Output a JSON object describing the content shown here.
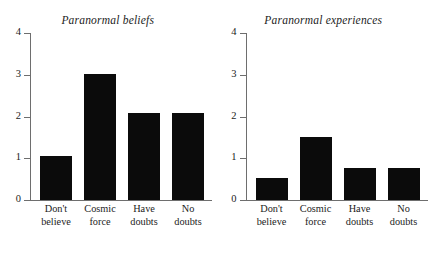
{
  "figure": {
    "background_color": "#ffffff",
    "bar_color": "#0b0b0b",
    "axis_color": "#6e6e6e",
    "text_color": "#1c1c1c"
  },
  "chart_data": [
    {
      "type": "bar",
      "title": "Paranormal beliefs",
      "xlabel": "",
      "ylabel": "",
      "categories": [
        "Don't believe",
        "Cosmic force",
        "Have doubts",
        "No doubts"
      ],
      "category_lines": [
        [
          "Don't",
          "believe"
        ],
        [
          "Cosmic",
          "force"
        ],
        [
          "Have",
          "doubts"
        ],
        [
          "No",
          "doubts"
        ]
      ],
      "values": [
        1.05,
        3.02,
        2.08,
        2.08
      ],
      "ylim": [
        0,
        4
      ],
      "yticks": [
        0,
        1,
        2,
        3,
        4
      ],
      "ytick_labels": [
        "0",
        "1",
        "2",
        "3",
        "4"
      ],
      "grid": false,
      "legend": "none"
    },
    {
      "type": "bar",
      "title": "Paranormal experiences",
      "xlabel": "",
      "ylabel": "",
      "categories": [
        "Don't believe",
        "Cosmic force",
        "Have doubts",
        "No doubts"
      ],
      "category_lines": [
        [
          "Don't",
          "believe"
        ],
        [
          "Cosmic",
          "force"
        ],
        [
          "Have",
          "doubts"
        ],
        [
          "No",
          "doubts"
        ]
      ],
      "values": [
        0.53,
        1.51,
        0.77,
        0.77
      ],
      "ylim": [
        0,
        4
      ],
      "yticks": [
        0,
        1,
        2,
        3,
        4
      ],
      "ytick_labels": [
        "0",
        "1",
        "2",
        "3",
        "4"
      ],
      "grid": false,
      "legend": "none"
    }
  ]
}
